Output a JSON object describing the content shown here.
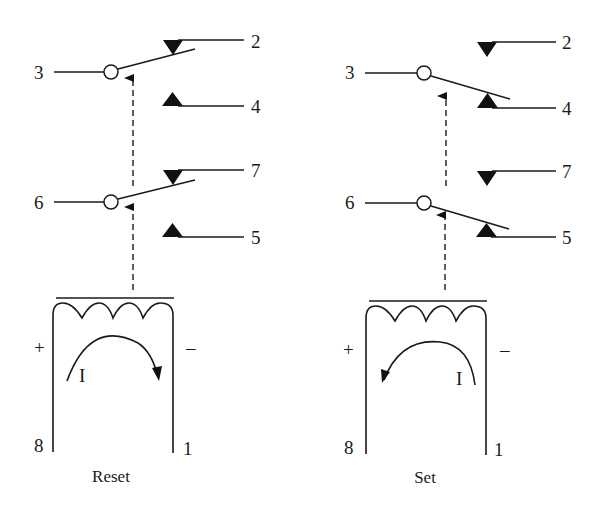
{
  "diagram": {
    "type": "latching relay schematic",
    "panels": [
      {
        "id": "reset",
        "caption": "Reset",
        "pins": {
          "p2": "2",
          "p3": "3",
          "p4": "4",
          "p5": "5",
          "p6": "6",
          "p7": "7",
          "p8": "8",
          "p1": "1"
        },
        "polarity": {
          "left": "+",
          "right": "–"
        },
        "current_label": "I",
        "current_direction": "clockwise",
        "contacts": [
          {
            "common": "3",
            "closed_to": "2",
            "open_to": "4"
          },
          {
            "common": "6",
            "closed_to": "7",
            "open_to": "5"
          }
        ]
      },
      {
        "id": "set",
        "caption": "Set",
        "pins": {
          "p2": "2",
          "p3": "3",
          "p4": "4",
          "p5": "5",
          "p6": "6",
          "p7": "7",
          "p8": "8",
          "p1": "1"
        },
        "polarity": {
          "left": "+",
          "right": "–"
        },
        "current_label": "I",
        "current_direction": "counterclockwise",
        "contacts": [
          {
            "common": "3",
            "closed_to": "4",
            "open_to": "2"
          },
          {
            "common": "6",
            "closed_to": "5",
            "open_to": "7"
          }
        ]
      }
    ]
  }
}
